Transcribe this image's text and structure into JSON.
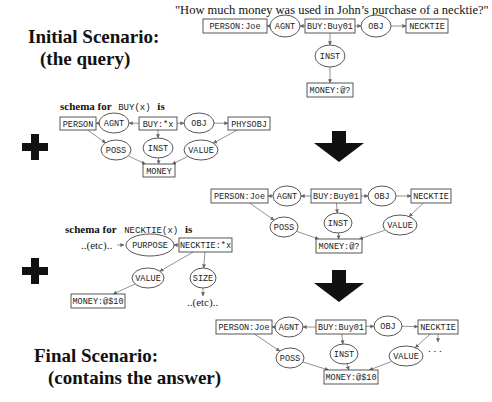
{
  "titles": {
    "initial_line1": "Initial Scenario:",
    "initial_line2": "(the query)",
    "final_line1": "Final Scenario:",
    "final_line2": "(contains the answer)"
  },
  "query": "\"How much money was used in John’s purchase of a necktie?\"",
  "schema_buy": {
    "prefix": "schema for",
    "mono": "BUY(x)",
    "suffix": "is"
  },
  "schema_necktie": {
    "prefix": "schema for",
    "mono": "NECKTIE(x)",
    "suffix": "is"
  },
  "etc_label": "..(etc)..",
  "ellipsis": ". . .",
  "graphs": {
    "query": {
      "nodes": [
        {
          "id": "person",
          "type": "box",
          "label": "PERSON:Joe",
          "x": 203,
          "y": 19,
          "w": 64,
          "h": 14
        },
        {
          "id": "agnt",
          "type": "oval",
          "label": "AGNT",
          "x": 285,
          "y": 26,
          "rx": 15,
          "ry": 11
        },
        {
          "id": "buy",
          "type": "box",
          "label": "BUY:Buy01",
          "x": 305,
          "y": 19,
          "w": 50,
          "h": 14
        },
        {
          "id": "obj",
          "type": "oval",
          "label": "OBJ",
          "x": 376,
          "y": 26,
          "rx": 15,
          "ry": 11
        },
        {
          "id": "neck",
          "type": "box",
          "label": "NECKTIE",
          "x": 406,
          "y": 19,
          "w": 42,
          "h": 14
        },
        {
          "id": "inst",
          "type": "oval",
          "label": "INST",
          "x": 330,
          "y": 56,
          "rx": 15,
          "ry": 11
        },
        {
          "id": "money",
          "type": "box",
          "label": "MONEY:@?",
          "x": 307,
          "y": 83,
          "w": 46,
          "h": 14
        }
      ],
      "edges": [
        [
          "buy",
          "agnt"
        ],
        [
          "agnt",
          "person"
        ],
        [
          "buy",
          "obj"
        ],
        [
          "obj",
          "neck"
        ],
        [
          "buy",
          "inst"
        ],
        [
          "inst",
          "money"
        ]
      ]
    },
    "schema_buy": {
      "nodes": [
        {
          "id": "person",
          "type": "box",
          "label": "PERSON",
          "x": 60,
          "y": 117,
          "w": 36,
          "h": 13
        },
        {
          "id": "agnt",
          "type": "oval",
          "label": "AGNT",
          "x": 114,
          "y": 123,
          "rx": 15,
          "ry": 10
        },
        {
          "id": "buy",
          "type": "box",
          "label": "BUY:*x",
          "x": 139,
          "y": 117,
          "w": 38,
          "h": 13
        },
        {
          "id": "obj",
          "type": "oval",
          "label": "OBJ",
          "x": 199,
          "y": 123,
          "rx": 15,
          "ry": 10
        },
        {
          "id": "phys",
          "type": "box",
          "label": "PHYSOBJ",
          "x": 228,
          "y": 117,
          "w": 42,
          "h": 13
        },
        {
          "id": "poss",
          "type": "oval",
          "label": "POSS",
          "x": 116,
          "y": 150,
          "rx": 15,
          "ry": 10
        },
        {
          "id": "inst",
          "type": "oval",
          "label": "INST",
          "x": 158,
          "y": 148,
          "rx": 15,
          "ry": 10
        },
        {
          "id": "value",
          "type": "oval",
          "label": "VALUE",
          "x": 201,
          "y": 150,
          "rx": 17,
          "ry": 10
        },
        {
          "id": "money",
          "type": "box",
          "label": "MONEY",
          "x": 143,
          "y": 164,
          "w": 32,
          "h": 13
        }
      ],
      "edges": [
        [
          "buy",
          "agnt"
        ],
        [
          "agnt",
          "person"
        ],
        [
          "buy",
          "obj"
        ],
        [
          "obj",
          "phys"
        ],
        [
          "person",
          "poss"
        ],
        [
          "buy",
          "inst"
        ],
        [
          "phys",
          "value"
        ],
        [
          "poss",
          "money"
        ],
        [
          "inst",
          "money"
        ],
        [
          "value",
          "money"
        ]
      ]
    },
    "middle": {
      "nodes": [
        {
          "id": "person",
          "type": "box",
          "label": "PERSON:Joe",
          "x": 211,
          "y": 189,
          "w": 57,
          "h": 14
        },
        {
          "id": "agnt",
          "type": "oval",
          "label": "AGNT",
          "x": 287,
          "y": 196,
          "rx": 14,
          "ry": 10
        },
        {
          "id": "buy",
          "type": "box",
          "label": "BUY:Buy01",
          "x": 311,
          "y": 189,
          "w": 50,
          "h": 14
        },
        {
          "id": "obj",
          "type": "oval",
          "label": "OBJ",
          "x": 382,
          "y": 196,
          "rx": 14,
          "ry": 10
        },
        {
          "id": "neck",
          "type": "box",
          "label": "NECKTIE",
          "x": 411,
          "y": 189,
          "w": 40,
          "h": 14
        },
        {
          "id": "poss",
          "type": "oval",
          "label": "POSS",
          "x": 284,
          "y": 227,
          "rx": 14,
          "ry": 10
        },
        {
          "id": "inst",
          "type": "oval",
          "label": "INST",
          "x": 338,
          "y": 223,
          "rx": 14,
          "ry": 10
        },
        {
          "id": "value",
          "type": "oval",
          "label": "VALUE",
          "x": 400,
          "y": 225,
          "rx": 17,
          "ry": 10
        },
        {
          "id": "money",
          "type": "box",
          "label": "MONEY:@?",
          "x": 316,
          "y": 239,
          "w": 46,
          "h": 14
        }
      ],
      "edges": [
        [
          "buy",
          "agnt"
        ],
        [
          "agnt",
          "person"
        ],
        [
          "buy",
          "obj"
        ],
        [
          "obj",
          "neck"
        ],
        [
          "person",
          "poss"
        ],
        [
          "buy",
          "inst"
        ],
        [
          "neck",
          "value"
        ],
        [
          "poss",
          "money"
        ],
        [
          "inst",
          "money"
        ],
        [
          "value",
          "money"
        ]
      ]
    },
    "schema_necktie": {
      "nodes": [
        {
          "id": "purpose",
          "type": "oval",
          "label": "PURPOSE",
          "x": 150,
          "y": 245,
          "rx": 24,
          "ry": 11
        },
        {
          "id": "neck",
          "type": "box",
          "label": "NECKTIE:*x",
          "x": 179,
          "y": 238,
          "w": 53,
          "h": 14
        },
        {
          "id": "value",
          "type": "oval",
          "label": "VALUE",
          "x": 148,
          "y": 278,
          "rx": 16,
          "ry": 10
        },
        {
          "id": "size",
          "type": "oval",
          "label": "SIZE",
          "x": 203,
          "y": 278,
          "rx": 13,
          "ry": 10
        },
        {
          "id": "money",
          "type": "box",
          "label": "MONEY:@$10",
          "x": 71,
          "y": 294,
          "w": 54,
          "h": 14
        }
      ],
      "edges": [
        [
          "neck",
          "purpose"
        ],
        [
          "neck",
          "value"
        ],
        [
          "neck",
          "size"
        ],
        [
          "value",
          "money"
        ]
      ]
    },
    "final": {
      "nodes": [
        {
          "id": "person",
          "type": "box",
          "label": "PERSON:Joe",
          "x": 216,
          "y": 320,
          "w": 56,
          "h": 14
        },
        {
          "id": "agnt",
          "type": "oval",
          "label": "AGNT",
          "x": 289,
          "y": 327,
          "rx": 14,
          "ry": 10
        },
        {
          "id": "buy",
          "type": "box",
          "label": "BUY:Buy01",
          "x": 316,
          "y": 320,
          "w": 50,
          "h": 14
        },
        {
          "id": "obj",
          "type": "oval",
          "label": "OBJ",
          "x": 388,
          "y": 326,
          "rx": 14,
          "ry": 10
        },
        {
          "id": "neck",
          "type": "box",
          "label": "NECKTIE",
          "x": 418,
          "y": 320,
          "w": 40,
          "h": 14
        },
        {
          "id": "poss",
          "type": "oval",
          "label": "POSS",
          "x": 290,
          "y": 358,
          "rx": 14,
          "ry": 10
        },
        {
          "id": "inst",
          "type": "oval",
          "label": "INST",
          "x": 344,
          "y": 354,
          "rx": 14,
          "ry": 10
        },
        {
          "id": "value",
          "type": "oval",
          "label": "VALUE",
          "x": 406,
          "y": 356,
          "rx": 17,
          "ry": 10
        },
        {
          "id": "money",
          "type": "box",
          "label": "MONEY:@$10",
          "x": 324,
          "y": 370,
          "w": 54,
          "h": 14
        }
      ],
      "edges": [
        [
          "buy",
          "agnt"
        ],
        [
          "agnt",
          "person"
        ],
        [
          "buy",
          "obj"
        ],
        [
          "obj",
          "neck"
        ],
        [
          "person",
          "poss"
        ],
        [
          "buy",
          "inst"
        ],
        [
          "neck",
          "value"
        ],
        [
          "poss",
          "money"
        ],
        [
          "inst",
          "money"
        ],
        [
          "value",
          "money"
        ]
      ]
    }
  },
  "colors": {
    "ink": "#111111",
    "edge": "#777777",
    "arrow": "#111111"
  }
}
